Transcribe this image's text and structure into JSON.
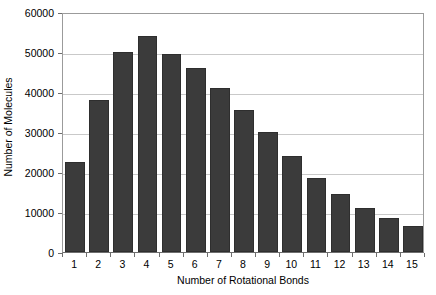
{
  "chart_data": {
    "type": "bar",
    "title": "",
    "xlabel": "Number of Rotational Bonds",
    "ylabel": "Number of Molecules",
    "categories": [
      "1",
      "2",
      "3",
      "4",
      "5",
      "6",
      "7",
      "8",
      "9",
      "10",
      "11",
      "12",
      "13",
      "14",
      "15"
    ],
    "values": [
      22500,
      38000,
      50000,
      54000,
      49500,
      46000,
      41000,
      35500,
      30000,
      24000,
      18500,
      14500,
      11000,
      8500,
      6500
    ],
    "ylim": [
      0,
      60000
    ],
    "yticks": [
      0,
      10000,
      20000,
      30000,
      40000,
      50000,
      60000
    ],
    "ytick_labels": [
      "0",
      "10000",
      "20000",
      "30000",
      "40000",
      "50000",
      "60000"
    ],
    "grid": true,
    "legend": false,
    "bar_color": "#3b3b3b",
    "gridline_color": "#c9c9c9",
    "axis_color": "#6e6e6e",
    "background_color": "#ffffff"
  }
}
